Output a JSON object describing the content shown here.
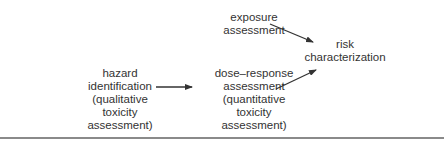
{
  "diagram": {
    "nodes": {
      "exposure": {
        "lines": [
          "exposure",
          "assessment"
        ]
      },
      "risk": {
        "lines": [
          "risk",
          "characterization"
        ]
      },
      "hazard": {
        "lines": [
          "hazard",
          "identification",
          "(qualitative",
          "toxicity",
          "assessment)"
        ]
      },
      "dose_response": {
        "lines": [
          "dose–response",
          "assessment",
          "(quantitative",
          "toxicity",
          "assessment)"
        ]
      }
    },
    "edges": [
      {
        "from": "hazard identification",
        "to": "dose–response assessment"
      },
      {
        "from": "exposure assessment",
        "to": "risk characterization"
      },
      {
        "from": "dose–response assessment",
        "to": "risk characterization"
      }
    ],
    "colors": {
      "text": "#333333",
      "arrow": "#333333",
      "rule": "#8a8a8a"
    }
  }
}
